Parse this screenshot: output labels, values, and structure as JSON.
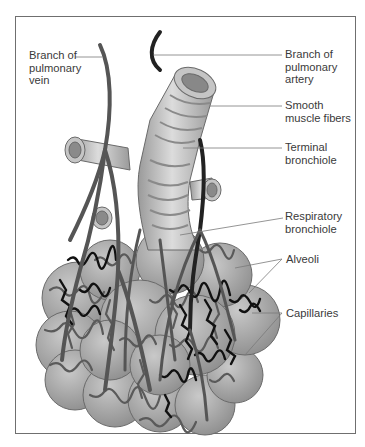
{
  "diagram": {
    "colors": {
      "frame": "#6f6f6f",
      "label_text": "#3a3a3a",
      "leader_line": "#7a7a7a",
      "alveolus_fill": "#a9a9a9",
      "bronchiole_fill": "#c8c8c8",
      "vein": "#555555",
      "artery": "#222222",
      "capillary_dark": "#111111"
    },
    "labels": [
      {
        "id": "pulmonary-vein",
        "lines": [
          "Branch of",
          "pulmonary",
          "vein"
        ]
      },
      {
        "id": "pulmonary-artery",
        "lines": [
          "Branch of",
          "pulmonary",
          "artery"
        ]
      },
      {
        "id": "smooth-muscle",
        "lines": [
          "Smooth",
          "muscle fibers"
        ]
      },
      {
        "id": "terminal-bronchiole",
        "lines": [
          "Terminal",
          "bronchiole"
        ]
      },
      {
        "id": "respiratory-bronchiole",
        "lines": [
          "Respiratory",
          "bronchiole"
        ]
      },
      {
        "id": "alveoli",
        "lines": [
          "Alveoli"
        ]
      },
      {
        "id": "capillaries",
        "lines": [
          "Capillaries"
        ]
      }
    ]
  }
}
